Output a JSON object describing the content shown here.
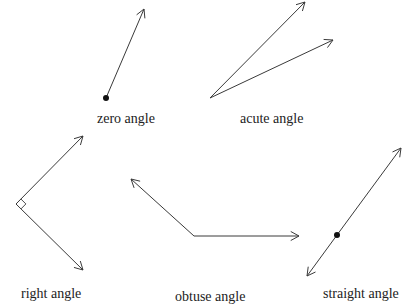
{
  "colors": {
    "stroke": "#3a3a3a",
    "dot": "#111111",
    "text": "#222222",
    "background": "#ffffff"
  },
  "angles": [
    {
      "id": "zero",
      "label": "zero angle",
      "label_pos": [
        97,
        112
      ],
      "vertex": [
        106,
        98
      ],
      "vertex_dot": true,
      "rays": [
        [
          144,
          9
        ]
      ]
    },
    {
      "id": "acute",
      "label": "acute angle",
      "label_pos": [
        240,
        112
      ],
      "vertex": [
        210,
        98
      ],
      "vertex_dot": false,
      "rays": [
        [
          305,
          2
        ],
        [
          333,
          40
        ]
      ]
    },
    {
      "id": "right",
      "label": "right angle",
      "label_pos": [
        21,
        287
      ],
      "vertex": [
        16,
        204
      ],
      "vertex_dot": false,
      "right_angle_marker": true,
      "rays": [
        [
          83,
          136
        ],
        [
          83,
          270
        ]
      ]
    },
    {
      "id": "obtuse",
      "label": "obtuse angle",
      "label_pos": [
        175,
        290
      ],
      "vertex": [
        194,
        236
      ],
      "vertex_dot": false,
      "rays": [
        [
          131,
          179
        ],
        [
          299,
          236
        ]
      ]
    },
    {
      "id": "straight",
      "label": "straight angle",
      "label_pos": [
        323,
        287
      ],
      "vertex": [
        337,
        235
      ],
      "vertex_dot": true,
      "rays": [
        [
          401,
          148
        ],
        [
          307,
          276
        ]
      ]
    }
  ]
}
